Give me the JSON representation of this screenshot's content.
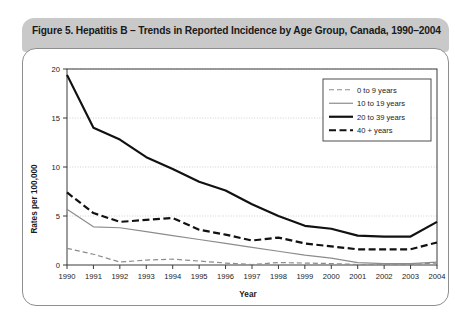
{
  "figure": {
    "title": "Figure 5. Hepatitis B – Trends in Reported Incidence by Age Group, Canada, 1990–2004"
  },
  "chart_data": {
    "type": "line",
    "title": "Figure 5. Hepatitis B – Trends in Reported Incidence by Age Group, Canada, 1990–2004",
    "xlabel": "Year",
    "ylabel": "Rates per 100,000",
    "x": [
      1990,
      1991,
      1992,
      1993,
      1994,
      1995,
      1996,
      1997,
      1998,
      1999,
      2000,
      2001,
      2002,
      2003,
      2004
    ],
    "xtick_labels": [
      "1990",
      "1991",
      "1992",
      "1993",
      "1994",
      "1995",
      "1996",
      "1997",
      "1998",
      "1999",
      "2000",
      "2001",
      "2002",
      "2003",
      "2004"
    ],
    "ylim": [
      0,
      20
    ],
    "ytick_labels": [
      "0",
      "5",
      "10",
      "15",
      "20"
    ],
    "yticks": [
      0,
      5,
      10,
      15,
      20
    ],
    "grid": "horizontal-dotted",
    "legend_position": "top-right",
    "series": [
      {
        "name": "0 to 9 years",
        "style": "dashed-thin-grey",
        "color": "#8c8c8c",
        "values": [
          1.7,
          1.1,
          0.3,
          0.5,
          0.6,
          0.4,
          0.2,
          0.05,
          0.25,
          0.2,
          0.15,
          0.05,
          0.05,
          0.05,
          0.2
        ]
      },
      {
        "name": "10 to 19 years",
        "style": "solid-thin-grey",
        "color": "#8c8c8c",
        "values": [
          5.7,
          3.9,
          3.8,
          3.4,
          3.0,
          2.6,
          2.2,
          1.8,
          1.4,
          1.0,
          0.7,
          0.25,
          0.15,
          0.15,
          0.3
        ]
      },
      {
        "name": "20 to 39 years",
        "style": "solid-thick-black",
        "color": "#111111",
        "values": [
          19.4,
          14.0,
          12.8,
          11.0,
          9.8,
          8.5,
          7.6,
          6.2,
          5.0,
          4.0,
          3.7,
          3.0,
          2.9,
          2.9,
          4.4
        ]
      },
      {
        "name": "40 + years",
        "style": "dashed-thick-black",
        "color": "#111111",
        "values": [
          7.4,
          5.3,
          4.4,
          4.6,
          4.8,
          3.6,
          3.1,
          2.5,
          2.8,
          2.2,
          1.9,
          1.6,
          1.6,
          1.6,
          2.3
        ]
      }
    ]
  }
}
